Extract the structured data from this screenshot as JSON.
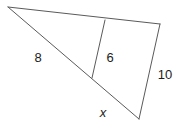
{
  "figure": {
    "kind": "similar-triangles-diagram",
    "canvas": {
      "width": 182,
      "height": 129,
      "background": "#ffffff"
    },
    "stroke_color": "#5a5a5a",
    "stroke_width": 1,
    "text_color": "#1c1c1c",
    "vertices": {
      "apex": {
        "x": 8,
        "y": 7
      },
      "top_right": {
        "x": 160,
        "y": 24
      },
      "bottom_right": {
        "x": 139,
        "y": 119
      },
      "transversal_top": {
        "x": 105,
        "y": 20
      },
      "transversal_bottom": {
        "x": 92,
        "y": 78
      }
    },
    "edges": [
      {
        "name": "top-edge",
        "from": "apex",
        "to": "top_right"
      },
      {
        "name": "left-edge",
        "from": "apex",
        "to": "bottom_right"
      },
      {
        "name": "right-edge",
        "from": "top_right",
        "to": "bottom_right"
      },
      {
        "name": "transversal-edge",
        "from": "transversal_top",
        "to": "transversal_bottom"
      }
    ],
    "labels": [
      {
        "name": "side-label-8",
        "text": "8",
        "x": 38,
        "y": 57,
        "italic": false
      },
      {
        "name": "side-label-6",
        "text": "6",
        "x": 110,
        "y": 57,
        "italic": false
      },
      {
        "name": "side-label-10",
        "text": "10",
        "x": 165,
        "y": 74,
        "italic": false
      },
      {
        "name": "side-label-x",
        "text": "x",
        "x": 103,
        "y": 112,
        "italic": true
      }
    ]
  }
}
